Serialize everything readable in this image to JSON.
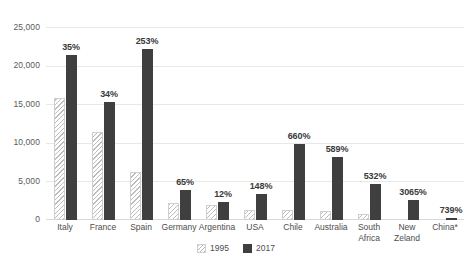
{
  "chart_data": {
    "type": "bar",
    "title": "",
    "xlabel": "",
    "ylabel": "",
    "ylim": [
      0,
      25000
    ],
    "yticks": [
      0,
      5000,
      10000,
      15000,
      20000,
      25000
    ],
    "ytick_labels": [
      "0",
      "5,000",
      "10,000",
      "15,000",
      "20,000",
      "25,000"
    ],
    "grid": true,
    "legend_position": "bottom",
    "categories": [
      "Italy",
      "France",
      "Spain",
      "Germany",
      "Argentina",
      "USA",
      "Chile",
      "Australia",
      "South Africa",
      "New Zeland",
      "China*"
    ],
    "series": [
      {
        "name": "1995",
        "values": [
          15800,
          11400,
          6200,
          2250,
          1950,
          1350,
          1300,
          1200,
          750,
          0,
          0
        ]
      },
      {
        "name": "2017",
        "values": [
          21350,
          15350,
          22100,
          3900,
          2300,
          3400,
          9900,
          8100,
          4650,
          2600,
          200
        ]
      }
    ],
    "annotations": [
      "35%",
      "34%",
      "253%",
      "65%",
      "12%",
      "148%",
      "660%",
      "589%",
      "532%",
      "3065%",
      "739%"
    ],
    "colors": {
      "series_1995": "#f3f3f3",
      "series_1995_hatch": "#bdbdbd",
      "series_2017": "#3f3f3f",
      "gridline": "#e8e8e8",
      "axis_text": "#5a5a5a",
      "label_text": "#3a3a3a"
    }
  },
  "legend": {
    "items": [
      {
        "label": "1995"
      },
      {
        "label": "2017"
      }
    ]
  }
}
